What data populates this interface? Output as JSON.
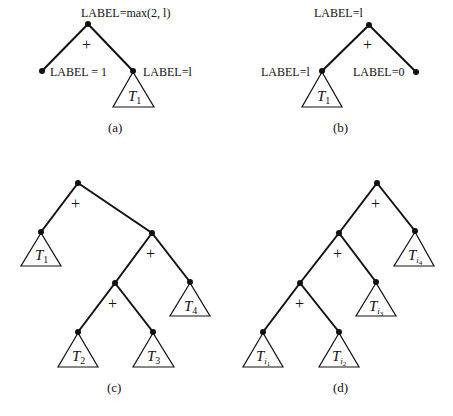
{
  "figure": {
    "panels": [
      {
        "id": "a",
        "caption": "(a)",
        "root_label": "LABEL=max(2, l)",
        "operator": "+",
        "left_leaf_label": "LABEL = 1",
        "right_node_label": "LABEL=l",
        "subtrees": [
          {
            "name": "T",
            "sub": "1"
          }
        ]
      },
      {
        "id": "b",
        "caption": "(b)",
        "root_label": "LABEL=l",
        "operator": "+",
        "left_node_label": "LABEL=l",
        "right_leaf_label": "LABEL=0",
        "subtrees": [
          {
            "name": "T",
            "sub": "1"
          }
        ]
      },
      {
        "id": "c",
        "caption": "(c)",
        "operators": [
          "+",
          "+",
          "+"
        ],
        "subtrees": [
          {
            "name": "T",
            "sub": "1"
          },
          {
            "name": "T",
            "sub": "2"
          },
          {
            "name": "T",
            "sub": "3"
          },
          {
            "name": "T",
            "sub": "4"
          }
        ]
      },
      {
        "id": "d",
        "caption": "(d)",
        "operators": [
          "+",
          "+",
          "+"
        ],
        "subtrees": [
          {
            "name": "T",
            "sub": "i",
            "subsub": "1"
          },
          {
            "name": "T",
            "sub": "i",
            "subsub": "2"
          },
          {
            "name": "T",
            "sub": "i",
            "subsub": "3"
          },
          {
            "name": "T",
            "sub": "i",
            "subsub": "4"
          }
        ]
      }
    ]
  }
}
